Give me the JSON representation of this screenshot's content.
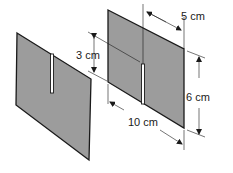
{
  "diagram": {
    "colors": {
      "plate_fill": "#9c9c9c",
      "line": "#1a1a1a",
      "background": "#ffffff"
    },
    "plates": [
      {
        "name": "left-plate",
        "slot": "from top edge"
      },
      {
        "name": "right-plate",
        "slot": "from bottom edge"
      }
    ],
    "dimensions": {
      "slot_length": "3 cm",
      "half_width": "5 cm",
      "height": "6 cm",
      "width": "10 cm"
    }
  }
}
